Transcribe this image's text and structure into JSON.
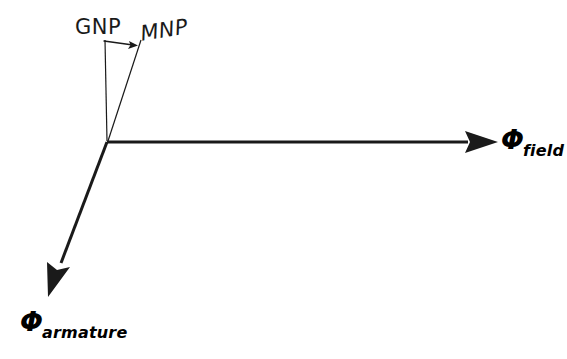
{
  "figure": {
    "type": "vector-phasor-diagram",
    "background_color": "#ffffff",
    "line_color": "#1a1a1a",
    "width": 567,
    "height": 359
  },
  "labels": {
    "gnp": "GNP",
    "mnp": "MNP",
    "phi_symbol": "Φ",
    "field_subscript": "field",
    "armature_subscript": "armature"
  },
  "icons": {
    "pointer_arrow": "arrow-right-icon",
    "field_arrow": "arrow-right-icon",
    "armature_arrow": "arrow-down-left-icon"
  },
  "geometry": {
    "vertex": {
      "x": 107,
      "y": 142
    },
    "field_vector": {
      "from": {
        "x": 107,
        "y": 142
      },
      "to": {
        "x": 498,
        "y": 142
      },
      "stroke_width": 3,
      "arrowhead": {
        "length": 33,
        "half_width": 11
      }
    },
    "armature_vector": {
      "from": {
        "x": 107,
        "y": 142
      },
      "to": {
        "x": 48,
        "y": 297
      },
      "stroke_width": 3,
      "arrowhead": {
        "length": 36,
        "half_width": 11
      }
    },
    "gnp_line": {
      "from": {
        "x": 105,
        "y": 40
      },
      "to": {
        "x": 107,
        "y": 141
      },
      "stroke_width": 1.2
    },
    "mnp_line": {
      "from": {
        "x": 141,
        "y": 40
      },
      "to": {
        "x": 108,
        "y": 141
      },
      "stroke_width": 1.2
    },
    "pointer_arrow": {
      "from": {
        "x": 104,
        "y": 41
      },
      "to": {
        "x": 137,
        "y": 45
      },
      "stroke_width": 1.2
    }
  }
}
